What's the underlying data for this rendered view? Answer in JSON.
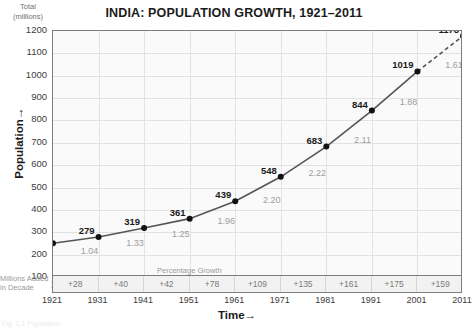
{
  "chart_data": {
    "type": "line",
    "title": "INDIA: POPULATION GROWTH, 1921–2011",
    "xlabel": "Time",
    "ylabel": "Population",
    "y_unit_label_line1": "Total",
    "y_unit_label_line2": "(millions)",
    "grid": true,
    "legend": "none",
    "xlim": [
      1921,
      2011
    ],
    "ylim": [
      100,
      1200
    ],
    "yticks": [
      1200,
      1100,
      1000,
      900,
      800,
      700,
      600,
      500,
      400,
      300,
      200,
      100
    ],
    "categories": [
      1921,
      1931,
      1941,
      1951,
      1961,
      1971,
      1981,
      1991,
      2001,
      2011
    ],
    "xticks": [
      "1921",
      "1931",
      "1941",
      "1951",
      "1961",
      "1971",
      "1981",
      "1991",
      "2001",
      "2011"
    ],
    "series": [
      {
        "name": "Total population (millions)",
        "values": [
          251,
          279,
          319,
          361,
          439,
          548,
          683,
          844,
          1019,
          1178
        ],
        "last_segment_style": "dashed"
      }
    ],
    "point_labels": [
      "251",
      "279",
      "319",
      "361",
      "439",
      "548",
      "683",
      "844",
      "1019",
      "1178"
    ],
    "growth_rates": {
      "label": "Percentage Growth Rate in Decade",
      "values": [
        "1.04",
        "1.33",
        "1.25",
        "1.96",
        "2.20",
        "2.22",
        "2.11",
        "1.88",
        "1.61"
      ]
    },
    "millions_added": {
      "label_line1": "Millions Added",
      "label_line2": "in Decade",
      "values": [
        "+28",
        "+40",
        "+42",
        "+78",
        "+109",
        "+135",
        "+161",
        "+175",
        "+159"
      ]
    },
    "colors": {
      "line": "#555555",
      "marker": "#111111",
      "plot_background": "#fafafa",
      "grid": "#e2e2e2",
      "frame": "#7d7d7d",
      "growth_text": "#9e9e9e",
      "added_text": "#7a7a7a"
    }
  },
  "caption": {
    "text": "Fig. 1.1 Population"
  },
  "axis_arrows": {
    "x": "→",
    "y": "→",
    "added": "➤"
  }
}
